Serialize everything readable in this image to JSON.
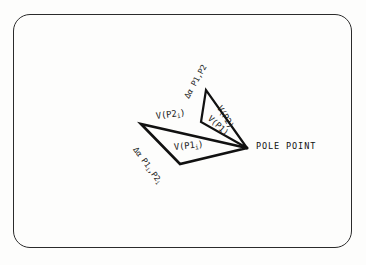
{
  "figure": {
    "frame": {
      "shape": "rounded-rectangle",
      "stroke_color": "#2b2b2b"
    },
    "background_color": "#fdfdfc",
    "line_color": "#111111",
    "text_color": "#1a1a1a"
  },
  "labels": {
    "pole_point": "POLE POINT",
    "v_p2_i": "V(P2",
    "v_p2_i_sub": "i",
    "v_p2_i_close": ")",
    "v_p1_i": "V(P1",
    "v_p1_i_sub": "i",
    "v_p1_i_close": ")",
    "v_p2": "V(P2)",
    "v_p1": "V(P1)",
    "delta_alpha_outer": "Δα P1,P2",
    "delta_alpha_inner_a": "Δα P1",
    "delta_alpha_inner_sub1": "i",
    "delta_alpha_inner_b": ",P2",
    "delta_alpha_inner_sub2": "i"
  },
  "geometry": {
    "pole_point": [
      247,
      148
    ],
    "large_triangle": {
      "vertices": [
        [
          141,
          124
        ],
        [
          180,
          164
        ],
        [
          247,
          148
        ]
      ],
      "stroke_width": 2.6
    },
    "small_triangle": {
      "vertices": [
        [
          206,
          90
        ],
        [
          201,
          122
        ],
        [
          247,
          148
        ]
      ],
      "stroke_width": 2.2
    }
  }
}
